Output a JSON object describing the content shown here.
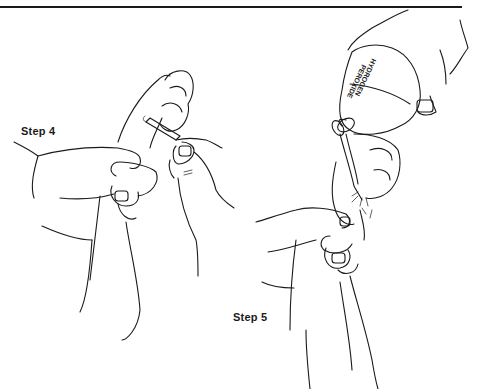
{
  "page": {
    "type": "instructional illustration",
    "background": "#ffffff",
    "line_color": "#1a1a1a"
  },
  "figures": [
    {
      "id": "step4",
      "label": "Step 4",
      "depiction": "hands holding a dog's paw while using tweezers between the toes"
    },
    {
      "id": "step5",
      "label": "Step 5",
      "depiction": "hand pouring a bottle onto a dog's paw held by another hand",
      "bottle_label_line1": "HYDROGEN",
      "bottle_label_line2": "PEROXIDE"
    }
  ]
}
